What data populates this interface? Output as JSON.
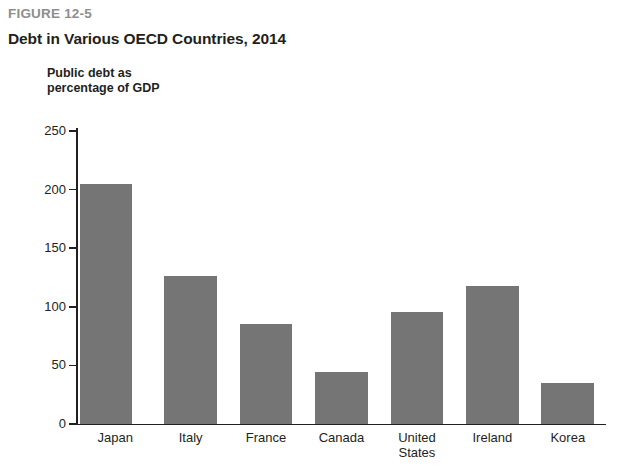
{
  "figure": {
    "number": "FIGURE 12-5",
    "title": "Debt in Various OECD Countries, 2014",
    "axis_title": "Public debt as\npercentage of GDP"
  },
  "colors": {
    "bar": "#757575",
    "axis": "#231f20",
    "figure_number": "#8e8e8e",
    "text": "#231f20",
    "background": "#ffffff"
  },
  "chart_data": {
    "type": "bar",
    "title": "Debt in Various OECD Countries, 2014",
    "subtitle": "FIGURE 12-5",
    "xlabel": "",
    "ylabel": "Public debt as percentage of GDP",
    "categories": [
      "Japan",
      "Italy",
      "France",
      "Canada",
      "United States",
      "Ireland",
      "Korea"
    ],
    "values": [
      205,
      126,
      85,
      44,
      96,
      118,
      35
    ],
    "ylim": [
      0,
      250
    ],
    "yticks": [
      0,
      50,
      100,
      150,
      200,
      250
    ],
    "ytick_labels": [
      "0",
      "50",
      "100",
      "150",
      "200",
      "250"
    ],
    "grid": false,
    "legend": false,
    "bar_color": "#757575",
    "orientation": "vertical"
  }
}
